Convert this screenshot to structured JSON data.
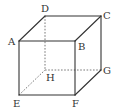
{
  "figure": {
    "type": "cube",
    "vertices": {
      "A": "A",
      "B": "B",
      "C": "C",
      "D": "D",
      "E": "E",
      "F": "F",
      "G": "G",
      "H": "H"
    },
    "visible_edges": [
      "AB",
      "BC",
      "CD",
      "DA",
      "AE",
      "BF",
      "CG",
      "EF",
      "FG"
    ],
    "hidden_edges": [
      "DH",
      "EH",
      "HG"
    ],
    "colors": {
      "edge": "#333333",
      "hidden_edge": "#555555"
    }
  }
}
